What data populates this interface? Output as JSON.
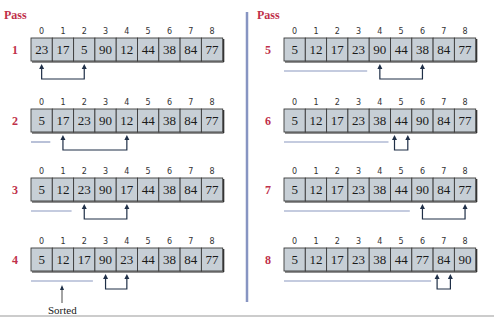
{
  "pass_heading": "Pass",
  "sorted_caption": "Sorted",
  "colors": {
    "accent": "#c0304a",
    "cell_fill": "#c7cfd6",
    "swap_arrow": "#1f2f47",
    "sorted_line": "#8a98bf",
    "divider": "#8795c2"
  },
  "indices": [
    "0",
    "1",
    "2",
    "3",
    "4",
    "5",
    "6",
    "7",
    "8"
  ],
  "passes": [
    {
      "pass": "1",
      "values": [
        "23",
        "17",
        "5",
        "90",
        "12",
        "44",
        "38",
        "84",
        "77"
      ],
      "swap": [
        0,
        2
      ],
      "sorted_count": 0
    },
    {
      "pass": "2",
      "values": [
        "5",
        "17",
        "23",
        "90",
        "12",
        "44",
        "38",
        "84",
        "77"
      ],
      "swap": [
        1,
        4
      ],
      "sorted_count": 1
    },
    {
      "pass": "3",
      "values": [
        "5",
        "12",
        "23",
        "90",
        "17",
        "44",
        "38",
        "84",
        "77"
      ],
      "swap": [
        2,
        4
      ],
      "sorted_count": 2
    },
    {
      "pass": "4",
      "values": [
        "5",
        "12",
        "17",
        "90",
        "23",
        "44",
        "38",
        "84",
        "77"
      ],
      "swap": [
        3,
        4
      ],
      "sorted_count": 3
    },
    {
      "pass": "5",
      "values": [
        "5",
        "12",
        "17",
        "23",
        "90",
        "44",
        "38",
        "84",
        "77"
      ],
      "swap": [
        4,
        6
      ],
      "sorted_count": 4
    },
    {
      "pass": "6",
      "values": [
        "5",
        "12",
        "17",
        "23",
        "38",
        "44",
        "90",
        "84",
        "77"
      ],
      "swap": [
        5,
        5
      ],
      "sorted_count": 5
    },
    {
      "pass": "7",
      "values": [
        "5",
        "12",
        "17",
        "23",
        "38",
        "44",
        "90",
        "84",
        "77"
      ],
      "swap": [
        6,
        8
      ],
      "sorted_count": 6
    },
    {
      "pass": "8",
      "values": [
        "5",
        "12",
        "17",
        "23",
        "38",
        "44",
        "77",
        "84",
        "90"
      ],
      "swap": [
        7,
        7
      ],
      "sorted_count": 7
    }
  ]
}
